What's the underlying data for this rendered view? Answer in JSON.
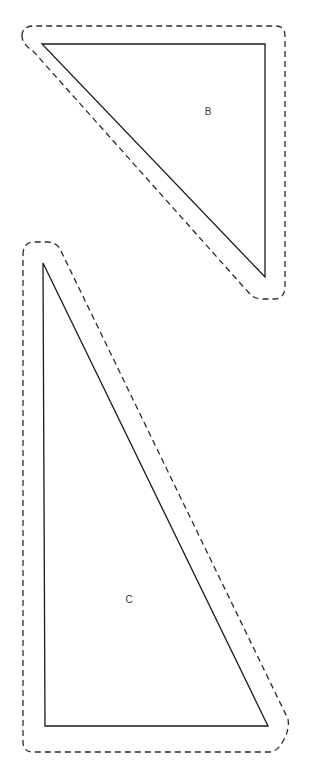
{
  "canvas": {
    "width": 309,
    "height": 774,
    "background": "#ffffff"
  },
  "style": {
    "solid_stroke_color": "#1a1a1a",
    "solid_stroke_width": 1.3,
    "dashed_stroke_color": "#2b2b2b",
    "dashed_stroke_width": 1.3,
    "dash_pattern": "6 4",
    "label_color": "#3a3a3a",
    "label_font_size": 10
  },
  "shapes": [
    {
      "id": "shape-b",
      "label": "B",
      "label_x": 208,
      "label_y": 112,
      "kind": "right-triangle",
      "orientation": "right-angle-top-right",
      "solid_points": "42,44 265,44 265,277",
      "seam_allowance_path": "M 22,36 Q 22,27 32,26 L 276,26 Q 285,26 285,36 L 285,288 Q 284,299 274,299 L 262,299 Q 254,299 249,293 L 33,51 Q 22,44 22,36 Z"
    },
    {
      "id": "shape-c",
      "label": "C",
      "label_x": 129,
      "label_y": 600,
      "kind": "right-triangle",
      "orientation": "right-angle-bottom-left",
      "solid_points": "43,263 268,726 45,726",
      "seam_allowance_path": "M 23,255 Q 23,243 33,242 L 47,242 Q 56,242 60,249 L 288,719 Q 290,730 282,743 Q 277,752 268,752 L 33,752 Q 23,752 23,742 Z"
    }
  ]
}
